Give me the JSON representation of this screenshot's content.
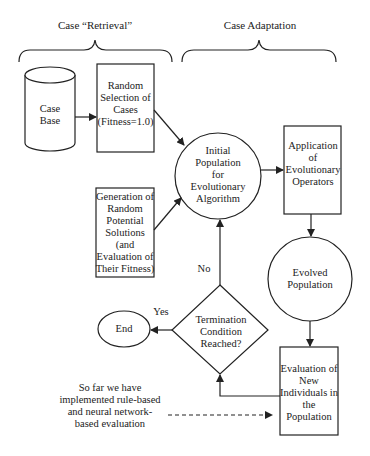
{
  "headers": {
    "retrieval": "Case “Retrieval”",
    "adaptation": "Case Adaptation"
  },
  "nodes": {
    "case_base": "Case\nBase",
    "random_selection": "Random\nSelection of\nCases\n(Fitness=1.0)",
    "generation": "Generation of\nRandom\nPotential\nSolutions\n(and\nEvaluation of\nTheir Fitness)",
    "initial_population": "Initial\nPopulation\nfor\nEvolutionary\nAlgorithm",
    "application": "Application\nof\nEvolutionary\nOperators",
    "evolved_population": "Evolved\nPopulation",
    "termination": "Termination\nCondition\nReached?",
    "end": "End",
    "evaluation": "Evaluation of\nNew\nIndividuals in\nthe\nPopulation"
  },
  "edge_labels": {
    "yes": "Yes",
    "no": "No"
  },
  "annotation": "So far we have\nimplemented rule-based\nand neural network-\nbased evaluation",
  "colors": {
    "stroke": "#222222",
    "background": "#ffffff"
  }
}
